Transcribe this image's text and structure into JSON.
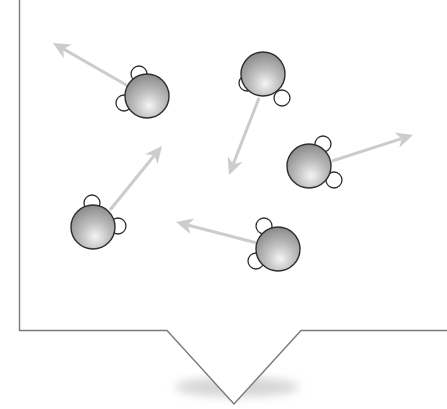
{
  "diagram": {
    "title": "",
    "colors": {
      "background": "#ffffff",
      "frame_stroke": "#7a7a7a",
      "arrow": "#cccccc",
      "oxygen_light": "#f2f2f2",
      "oxygen_dark": "#8a8a8a",
      "atom_stroke": "#2e2e2e",
      "hydrogen_fill": "#ffffff",
      "shadow": "#d8d8d8"
    },
    "molecules": [
      {
        "id": "molecule-1",
        "o": [
          147,
          96
        ],
        "h": [
          [
            139,
            74
          ],
          [
            124,
            103
          ]
        ],
        "arrow": {
          "from": [
            128,
            86
          ],
          "to": [
            53,
            43
          ]
        }
      },
      {
        "id": "molecule-2",
        "o": [
          263,
          74
        ],
        "h": [
          [
            247,
            83
          ],
          [
            282,
            98
          ]
        ],
        "arrow": {
          "from": [
            259,
            98
          ],
          "to": [
            229,
            175
          ]
        }
      },
      {
        "id": "molecule-3",
        "o": [
          309,
          166
        ],
        "h": [
          [
            323,
            144
          ],
          [
            334,
            180
          ]
        ],
        "arrow": {
          "from": [
            332,
            161
          ],
          "to": [
            413,
            135
          ]
        }
      },
      {
        "id": "molecule-4",
        "o": [
          93,
          227
        ],
        "h": [
          [
            92,
            203
          ],
          [
            118,
            226
          ]
        ],
        "arrow": {
          "from": [
            110,
            210
          ],
          "to": [
            162,
            146
          ]
        }
      },
      {
        "id": "molecule-5",
        "o": [
          278,
          249
        ],
        "h": [
          [
            264,
            226
          ],
          [
            256,
            261
          ]
        ],
        "arrow": {
          "from": [
            257,
            243
          ],
          "to": [
            176,
            222
          ]
        }
      }
    ]
  }
}
